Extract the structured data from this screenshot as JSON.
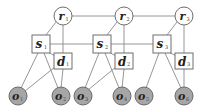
{
  "diagram": {
    "type": "graphical-model",
    "colors": {
      "edge": "#8a8a8a",
      "node_stroke": "#6e6e6e",
      "observed_fill": "#a6a6a6",
      "hidden_fill": "#ffffff"
    },
    "nodes": {
      "r": [
        {
          "id": "r1",
          "symbol": "r",
          "sub": "1"
        },
        {
          "id": "r2",
          "symbol": "r",
          "sub": "2"
        },
        {
          "id": "r3",
          "symbol": "r",
          "sub": "3"
        }
      ],
      "s": [
        {
          "id": "s1",
          "symbol": "s",
          "sub": "1"
        },
        {
          "id": "s2",
          "symbol": "s",
          "sub": "2"
        },
        {
          "id": "s3",
          "symbol": "s",
          "sub": "3"
        }
      ],
      "d": [
        {
          "id": "d1",
          "symbol": "d",
          "sub": "1"
        },
        {
          "id": "d2",
          "symbol": "d",
          "sub": "2"
        },
        {
          "id": "d3",
          "symbol": "d",
          "sub": "3"
        }
      ],
      "o": [
        {
          "id": "o1",
          "symbol": "o",
          "sub": "1"
        },
        {
          "id": "o2",
          "symbol": "o",
          "sub": "2"
        },
        {
          "id": "o3",
          "symbol": "o",
          "sub": "3"
        },
        {
          "id": "o4",
          "symbol": "o",
          "sub": "4"
        },
        {
          "id": "o5",
          "symbol": "o",
          "sub": "5"
        },
        {
          "id": "o6",
          "symbol": "o",
          "sub": "6"
        }
      ]
    },
    "edges": [
      [
        "r1",
        "r2"
      ],
      [
        "r2",
        "r3"
      ],
      [
        "s1",
        "s2"
      ],
      [
        "s2",
        "s3"
      ],
      [
        "r1",
        "s1"
      ],
      [
        "r2",
        "s2"
      ],
      [
        "r3",
        "s3"
      ],
      [
        "r1",
        "d1"
      ],
      [
        "r2",
        "d2"
      ],
      [
        "r3",
        "d3"
      ],
      [
        "s1",
        "d1"
      ],
      [
        "s2",
        "d2"
      ],
      [
        "s3",
        "d3"
      ],
      [
        "s1",
        "o1"
      ],
      [
        "s1",
        "o2"
      ],
      [
        "d1",
        "o1"
      ],
      [
        "d1",
        "o2"
      ],
      [
        "s2",
        "o3"
      ],
      [
        "s2",
        "o4"
      ],
      [
        "d2",
        "o3"
      ],
      [
        "d2",
        "o4"
      ],
      [
        "s3",
        "o5"
      ],
      [
        "s3",
        "o6"
      ],
      [
        "d3",
        "o6"
      ]
    ]
  }
}
